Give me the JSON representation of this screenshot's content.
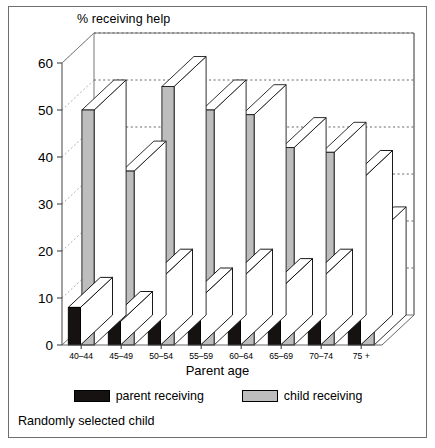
{
  "figure": {
    "title": "% receiving help",
    "xaxis_title": "Parent age",
    "caption": "Randomly selected child",
    "colors": {
      "parent_receiving": "#161212",
      "child_receiving": "#bdbdbd",
      "axis": "#555555",
      "background": "#ffffff"
    }
  },
  "legend": {
    "position": "bottom",
    "entries": [
      {
        "label": "parent receiving",
        "swatch": "dark"
      },
      {
        "label": "child receiving",
        "swatch": "light"
      }
    ]
  },
  "chart_data": {
    "type": "bar",
    "title": "% receiving help",
    "xlabel": "Parent age",
    "ylabel": "% receiving help",
    "ylim": [
      0,
      60
    ],
    "yticks": [
      0,
      10,
      20,
      30,
      40,
      50,
      60
    ],
    "grid": true,
    "three_d": true,
    "legend_position": "bottom",
    "categories": [
      "40–44",
      "45–49",
      "50–54",
      "55–59",
      "60–64",
      "65–69",
      "70–74",
      "75 +"
    ],
    "series": [
      {
        "name": "parent receiving",
        "color": "#161212",
        "values": [
          8,
          5,
          14,
          10,
          14,
          12,
          14,
          35
        ]
      },
      {
        "name": "child receiving",
        "color": "#bdbdbd",
        "values": [
          50,
          37,
          55,
          50,
          49,
          42,
          41,
          23
        ]
      }
    ],
    "annotations": [
      "Randomly selected child"
    ]
  }
}
